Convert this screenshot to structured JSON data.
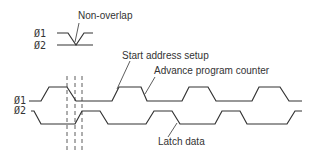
{
  "diagram": {
    "type": "timing-diagram",
    "inset": {
      "signals": [
        "Ø1",
        "Ø2"
      ],
      "annotation": "Non-overlap"
    },
    "signals": [
      {
        "name": "Ø1",
        "label": "Ø1"
      },
      {
        "name": "Ø2",
        "label": "Ø2"
      }
    ],
    "annotations": {
      "start_address_setup": "Start address setup",
      "advance_program_counter": "Advance program counter",
      "latch_data": "Latch data"
    },
    "colors": {
      "line": "#333333",
      "text": "#333333",
      "background": "#ffffff"
    }
  }
}
